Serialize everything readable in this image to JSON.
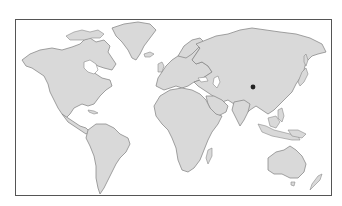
{
  "map": {
    "type": "world-outline",
    "style": "grayscale",
    "colors": {
      "background": "#ffffff",
      "frame": "#555555",
      "land": "#d9d9d9",
      "coastline": "#8a8a8a",
      "marker": "#222222"
    },
    "frame": {
      "x": 15,
      "y": 19,
      "width": 317,
      "height": 177
    },
    "continents": [
      "North America",
      "Greenland",
      "South America",
      "Europe",
      "Africa",
      "Asia",
      "Australia",
      "New Zealand"
    ],
    "markers": [
      {
        "name": "location-marker",
        "x": 253,
        "y": 87,
        "region": "Central Asia (Mongolia / Northern China)"
      }
    ]
  }
}
